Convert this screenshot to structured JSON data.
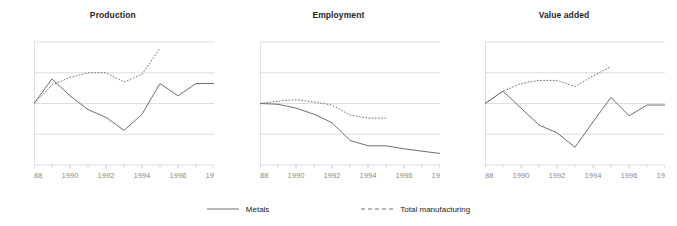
{
  "figure": {
    "width": 677,
    "height": 226,
    "background": "#ffffff",
    "line_color": "#6e6e6e",
    "grid_color": "#d4d4d4",
    "axis_color": "#b5b5b5",
    "tick_label_color": "#8a8a8a",
    "title_color": "#262626"
  },
  "legend": {
    "position": "bottom-center",
    "entries": [
      {
        "label": "Metals",
        "style": "solid",
        "key": "solid-line-key"
      },
      {
        "label": "Total manufacturing",
        "style": "dashed",
        "key": "dashed-line-key"
      }
    ]
  },
  "axes": {
    "ylim": [
      60,
      140
    ],
    "yticks": [
      60,
      80,
      100,
      120,
      140
    ],
    "ytick_labels": [
      "60",
      "80",
      "100",
      "120",
      "140"
    ],
    "xlim": [
      1988,
      1998
    ],
    "xticks": [
      1988,
      1990,
      1992,
      1994,
      1996,
      1998
    ],
    "xtick_labels": [
      "1988",
      "1990",
      "1992",
      "1994",
      "1996",
      "1998"
    ],
    "minor_xticks": [
      1989,
      1991,
      1993,
      1995,
      1997
    ],
    "grid": "horizontal"
  },
  "chart_data": [
    {
      "type": "line",
      "title": "Production",
      "xlabel": "",
      "ylabel": "",
      "xlim": [
        1988,
        1998
      ],
      "ylim": [
        60,
        140
      ],
      "x": [
        1988,
        1989,
        1990,
        1991,
        1992,
        1993,
        1994,
        1995,
        1996,
        1997,
        1998
      ],
      "series": [
        {
          "name": "Metals",
          "style": "solid",
          "values": [
            100,
            116,
            105,
            96,
            91,
            82.5,
            93,
            113,
            105,
            113,
            113
          ]
        },
        {
          "name": "Total manufacturing",
          "style": "dashed",
          "x": [
            1988,
            1989,
            1990,
            1991,
            1992,
            1993,
            1994,
            1995
          ],
          "values": [
            100,
            112,
            117,
            120,
            120,
            114,
            119,
            136
          ]
        }
      ]
    },
    {
      "type": "line",
      "title": "Employment",
      "xlabel": "",
      "ylabel": "",
      "xlim": [
        1988,
        1998
      ],
      "ylim": [
        60,
        140
      ],
      "x": [
        1988,
        1989,
        1990,
        1991,
        1992,
        1993,
        1994,
        1995,
        1996,
        1997,
        1998
      ],
      "series": [
        {
          "name": "Metals",
          "style": "solid",
          "values": [
            100,
            99.5,
            97,
            93,
            87.5,
            76,
            72.5,
            72.5,
            70.5,
            69,
            67.5
          ]
        },
        {
          "name": "Total manufacturing",
          "style": "dashed",
          "x": [
            1988,
            1989,
            1990,
            1991,
            1992,
            1993,
            1994,
            1995
          ],
          "values": [
            100,
            101.5,
            102.5,
            101,
            99,
            92.5,
            90.5,
            90.5
          ]
        }
      ]
    },
    {
      "type": "line",
      "title": "Value added",
      "xlabel": "",
      "ylabel": "",
      "xlim": [
        1988,
        1998
      ],
      "ylim": [
        60,
        140
      ],
      "x": [
        1988,
        1989,
        1990,
        1991,
        1992,
        1993,
        1994,
        1995,
        1996,
        1997,
        1998
      ],
      "series": [
        {
          "name": "Metals",
          "style": "solid",
          "values": [
            100,
            108,
            97,
            86,
            81,
            71.5,
            88,
            104,
            92,
            99,
            99
          ]
        },
        {
          "name": "Total manufacturing",
          "style": "dashed",
          "x": [
            1988,
            1989,
            1990,
            1991,
            1992,
            1993,
            1994,
            1995
          ],
          "values": [
            100,
            108,
            113,
            115,
            115,
            111,
            118,
            124
          ]
        }
      ]
    }
  ]
}
